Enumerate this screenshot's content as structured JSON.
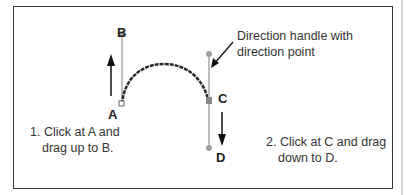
{
  "labels": {
    "a": "A",
    "b": "B",
    "c": "C",
    "d": "D"
  },
  "callout": {
    "line1": "Direction handle with",
    "line2": "direction point"
  },
  "steps": [
    {
      "line1": "1. Click at A and",
      "line2": "drag up to B."
    },
    {
      "line1": "2. Click at C and drag",
      "line2": "down to D."
    }
  ],
  "colors": {
    "frame": "#3a3a3a",
    "curve": "#2a2a2a",
    "handle": "#a0a0a0",
    "arrow": "#111111"
  }
}
